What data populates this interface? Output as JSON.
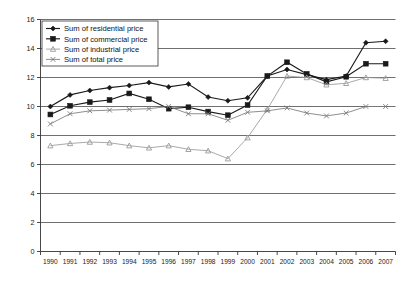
{
  "chart_data": {
    "type": "line",
    "title": "",
    "xlabel": "",
    "ylabel": "",
    "grid": true,
    "legend_position": "top-left",
    "ylim": [
      0,
      16
    ],
    "yticks": [
      0,
      2,
      4,
      6,
      8,
      10,
      12,
      14,
      16
    ],
    "categories": [
      "1990",
      "1991",
      "1992",
      "1993",
      "1994",
      "1995",
      "1996",
      "1997",
      "1998",
      "1999",
      "2000",
      "2001",
      "2002",
      "2003",
      "2004",
      "2005",
      "2006",
      "2007"
    ],
    "series": [
      {
        "name": "Sum of residential price",
        "marker": "diamond",
        "color": "#1a1a1a",
        "values": [
          10.0,
          10.8,
          11.1,
          11.3,
          11.45,
          11.65,
          11.35,
          11.55,
          10.65,
          10.4,
          10.6,
          12.1,
          12.55,
          12.2,
          11.85,
          12.1,
          14.4,
          14.5
        ]
      },
      {
        "name": "Sum of commercial price",
        "marker": "square",
        "color": "#1a1a1a",
        "values": [
          9.45,
          10.05,
          10.3,
          10.45,
          10.9,
          10.5,
          9.85,
          9.95,
          9.65,
          9.4,
          10.1,
          12.1,
          13.05,
          12.25,
          11.7,
          12.05,
          12.95,
          12.95
        ]
      },
      {
        "name": "Sum of industrial price",
        "marker": "triangle",
        "color": "#9a9a9a",
        "values": [
          7.3,
          7.45,
          7.55,
          7.5,
          7.3,
          7.15,
          7.3,
          7.05,
          6.95,
          6.4,
          7.85,
          9.8,
          12.1,
          12.0,
          11.5,
          11.6,
          12.0,
          11.95
        ]
      },
      {
        "name": "Sum of total price",
        "marker": "x",
        "color": "#7a7a7a",
        "values": [
          8.8,
          9.5,
          9.7,
          9.75,
          9.8,
          9.85,
          10.0,
          9.5,
          9.5,
          9.05,
          9.6,
          9.7,
          9.9,
          9.55,
          9.35,
          9.55,
          10.0,
          10.0
        ]
      }
    ]
  },
  "legend": {
    "entries": [
      {
        "label": "Sum of residential price"
      },
      {
        "label": "Sum of commercial price"
      },
      {
        "label": "Sum of industrial price"
      },
      {
        "label": "Sum of total price"
      }
    ]
  }
}
